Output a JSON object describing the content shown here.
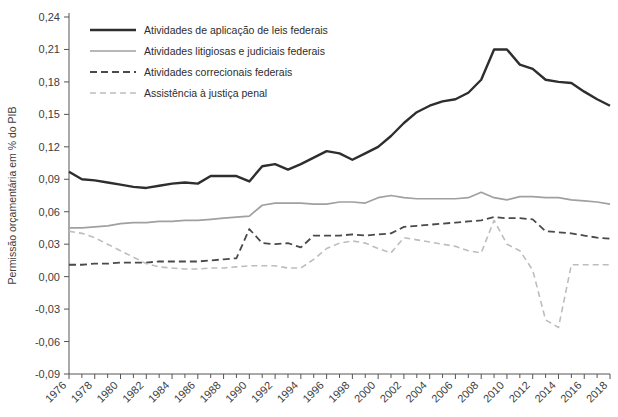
{
  "chart_data": {
    "type": "line",
    "title": "",
    "subtitle": "",
    "xlabel": "",
    "ylabel": "Permissão orçamentária em % do PIB",
    "xlim": [
      1976,
      2018
    ],
    "ylim": [
      -0.09,
      0.24
    ],
    "ytick_values": [
      0.24,
      0.21,
      0.18,
      0.15,
      0.12,
      0.09,
      0.06,
      0.03,
      0.0,
      -0.03,
      -0.06,
      -0.09
    ],
    "ytick_labels": [
      "0,24",
      "0,21",
      "0,18",
      "0,15",
      "0,12",
      "0,09",
      "0,06",
      "0,03",
      "0,00",
      "-0,03",
      "-0,06",
      "-0,09"
    ],
    "xtick_values": [
      1976,
      1978,
      1980,
      1982,
      1984,
      1986,
      1988,
      1990,
      1992,
      1994,
      1996,
      1998,
      2000,
      2002,
      2004,
      2006,
      2008,
      2010,
      2012,
      2014,
      2016,
      2018
    ],
    "xtick_labels": [
      "1976",
      "1978",
      "1980",
      "1982",
      "1984",
      "1986",
      "1988",
      "1990",
      "1992",
      "1994",
      "1996",
      "1998",
      "2000",
      "2002",
      "2004",
      "2006",
      "2008",
      "2010",
      "2012",
      "2014",
      "2016",
      "2018"
    ],
    "x": [
      1976,
      1977,
      1978,
      1979,
      1980,
      1981,
      1982,
      1983,
      1984,
      1985,
      1986,
      1987,
      1988,
      1989,
      1990,
      1991,
      1992,
      1993,
      1994,
      1995,
      1996,
      1997,
      1998,
      1999,
      2000,
      2001,
      2002,
      2003,
      2004,
      2005,
      2006,
      2007,
      2008,
      2009,
      2010,
      2011,
      2012,
      2013,
      2014,
      2015,
      2016,
      2017,
      2018
    ],
    "grid": false,
    "legend_position": "top-left",
    "series": [
      {
        "name": "Atividades de aplicação de leis federais",
        "color": "#2e2e2e",
        "style": "solid",
        "width": 2.4,
        "values": [
          0.097,
          0.09,
          0.089,
          0.087,
          0.085,
          0.083,
          0.082,
          0.084,
          0.086,
          0.087,
          0.086,
          0.093,
          0.093,
          0.093,
          0.088,
          0.102,
          0.104,
          0.099,
          0.104,
          0.11,
          0.116,
          0.114,
          0.108,
          0.114,
          0.12,
          0.13,
          0.142,
          0.152,
          0.158,
          0.162,
          0.164,
          0.17,
          0.182,
          0.21,
          0.21,
          0.196,
          0.192,
          0.182,
          0.18,
          0.179,
          0.171,
          0.164,
          0.158
        ]
      },
      {
        "name": "Atividades litigiosas e judiciais federais",
        "color": "#a0a0a0",
        "style": "solid",
        "width": 1.7,
        "values": [
          0.045,
          0.045,
          0.046,
          0.047,
          0.049,
          0.05,
          0.05,
          0.051,
          0.051,
          0.052,
          0.052,
          0.053,
          0.054,
          0.055,
          0.056,
          0.066,
          0.068,
          0.068,
          0.068,
          0.067,
          0.067,
          0.069,
          0.069,
          0.068,
          0.073,
          0.075,
          0.073,
          0.072,
          0.072,
          0.072,
          0.072,
          0.073,
          0.078,
          0.073,
          0.071,
          0.074,
          0.074,
          0.073,
          0.073,
          0.071,
          0.07,
          0.069,
          0.067
        ]
      },
      {
        "name": "Atividades correcionais federais",
        "color": "#4a4a4a",
        "style": "dashed",
        "width": 1.8,
        "values": [
          0.011,
          0.011,
          0.012,
          0.012,
          0.013,
          0.013,
          0.013,
          0.014,
          0.014,
          0.014,
          0.014,
          0.015,
          0.016,
          0.017,
          0.044,
          0.031,
          0.03,
          0.031,
          0.027,
          0.038,
          0.038,
          0.038,
          0.039,
          0.038,
          0.039,
          0.04,
          0.046,
          0.047,
          0.048,
          0.049,
          0.05,
          0.051,
          0.052,
          0.055,
          0.054,
          0.054,
          0.053,
          0.042,
          0.041,
          0.04,
          0.038,
          0.036,
          0.035
        ]
      },
      {
        "name": "Assistência à justiça penal",
        "color": "#bdbdbd",
        "style": "dashed",
        "width": 1.6,
        "values": [
          0.042,
          0.04,
          0.036,
          0.03,
          0.024,
          0.018,
          0.012,
          0.009,
          0.008,
          0.007,
          0.007,
          0.008,
          0.008,
          0.009,
          0.01,
          0.01,
          0.01,
          0.008,
          0.008,
          0.016,
          0.026,
          0.031,
          0.033,
          0.031,
          0.026,
          0.022,
          0.036,
          0.034,
          0.032,
          0.03,
          0.028,
          0.024,
          0.022,
          0.052,
          0.03,
          0.024,
          0.006,
          -0.04,
          -0.047,
          0.011,
          0.011,
          0.011,
          0.011
        ]
      }
    ]
  },
  "axis": {
    "ylabel": "Permissão orçamentária em % do PIB"
  }
}
